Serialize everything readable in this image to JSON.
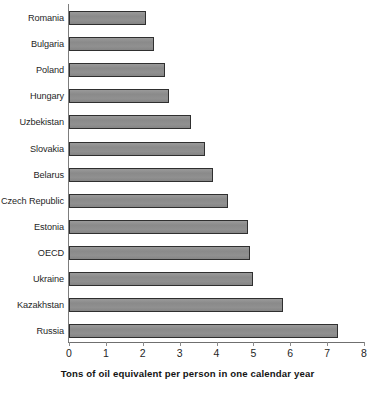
{
  "chart_data": {
    "type": "bar",
    "orientation": "horizontal",
    "title": "",
    "subtitle": "",
    "xlabel": "Tons of oil equivalent per person in one calendar year",
    "ylabel": "",
    "xlim": [
      0,
      8
    ],
    "xticks": [
      "0",
      "1",
      "2",
      "3",
      "4",
      "5",
      "6",
      "7",
      "8"
    ],
    "grid": false,
    "legend": false,
    "categories": [
      "Romania",
      "Bulgaria",
      "Poland",
      "Hungary",
      "Uzbekistan",
      "Slovakia",
      "Belarus",
      "Czech Republic",
      "Estonia",
      "OECD",
      "Ukraine",
      "Kazakhstan",
      "Russia"
    ],
    "values": [
      2.1,
      2.3,
      2.6,
      2.7,
      3.3,
      3.7,
      3.9,
      4.3,
      4.85,
      4.9,
      5.0,
      5.8,
      7.3
    ],
    "bar_color": "#8d8d8d",
    "bar_edge_color": "#2f2f2f",
    "axis_color": "#7d7d7d",
    "background_color": "#ffffff"
  }
}
